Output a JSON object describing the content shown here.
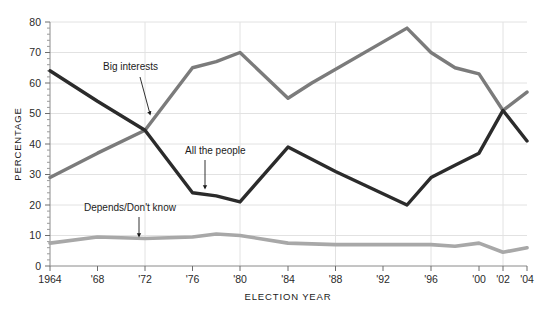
{
  "chart_data": {
    "type": "line",
    "title": "",
    "xlabel": "ELECTION YEAR",
    "ylabel": "PERCENTAGE",
    "grid": true,
    "legend": "none",
    "xlim": [
      1964,
      2004
    ],
    "ylim": [
      0,
      80
    ],
    "y_ticks": [
      0,
      10,
      20,
      30,
      40,
      50,
      60,
      70,
      80
    ],
    "x_ticks": [
      1964,
      1968,
      1972,
      1976,
      1980,
      1984,
      1988,
      1992,
      1996,
      2000,
      2002,
      2004
    ],
    "x_tick_labels": [
      "1964",
      "'68",
      "'72",
      "'76",
      "'80",
      "'84",
      "'88",
      "'92",
      "'96",
      "'00",
      "'02",
      "'04"
    ],
    "series": [
      {
        "name": "Big interests",
        "color": "#7b7b7b",
        "x": [
          1964,
          1968,
          1972,
          1976,
          1978,
          1980,
          1984,
          1986,
          1994,
          1996,
          1998,
          2000,
          2002,
          2004
        ],
        "values": [
          29,
          37,
          44.5,
          65,
          67,
          70,
          55,
          60,
          78,
          70,
          65,
          63,
          51,
          57
        ]
      },
      {
        "name": "All the people",
        "color": "#2b2b2b",
        "x": [
          1964,
          1968,
          1972,
          1976,
          1978,
          1980,
          1984,
          1988,
          1994,
          1996,
          1998,
          2000,
          2002,
          2004
        ],
        "values": [
          64,
          54,
          44.5,
          24,
          23,
          21,
          39,
          31,
          20,
          29,
          33,
          37,
          51,
          41
        ]
      },
      {
        "name": "Depends/Don't know",
        "color": "#a8a8a8",
        "x": [
          1964,
          1968,
          1972,
          1976,
          1978,
          1980,
          1984,
          1988,
          1992,
          1996,
          1998,
          2000,
          2002,
          2004
        ],
        "values": [
          7.5,
          9.5,
          9,
          9.5,
          10.5,
          10,
          7.5,
          7,
          7,
          7,
          6.5,
          7.5,
          4.5,
          6
        ]
      }
    ],
    "annotations": [
      {
        "text": "Big interests",
        "label_x": 103,
        "label_y": 70,
        "arrow_from_x": 140,
        "arrow_from_y": 77,
        "arrow_to_x": 150,
        "arrow_to_y": 114
      },
      {
        "text": "All the people",
        "label_x": 185,
        "label_y": 154,
        "arrow_from_x": 205,
        "arrow_from_y": 160,
        "arrow_to_x": 205,
        "arrow_to_y": 188
      },
      {
        "text": "Depends/Don't know",
        "label_x": 84,
        "label_y": 211,
        "arrow_from_x": 139,
        "arrow_from_y": 217,
        "arrow_to_x": 139,
        "arrow_to_y": 236
      }
    ]
  },
  "colors": {
    "big_interests": "#7b7b7b",
    "all_the_people": "#2b2b2b",
    "depends_dont_know": "#a8a8a8",
    "grid": "#e2e2e2",
    "axis": "#8a8a8a",
    "text": "#1b1b1b",
    "background": "#ffffff"
  }
}
